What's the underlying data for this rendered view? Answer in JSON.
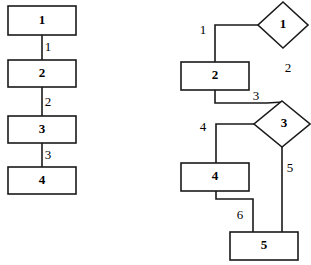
{
  "figure": {
    "type": "diagram",
    "background_color": "#ffffff",
    "line_color": "#1a1a1a"
  },
  "left_diagram": {
    "name": "linear-chain",
    "nodes": [
      {
        "id": "L1",
        "label": "1",
        "shape": "rectangle",
        "x": 8,
        "y": 6,
        "w": 68,
        "h": 29
      },
      {
        "id": "L2",
        "label": "2",
        "shape": "rectangle",
        "x": 8,
        "y": 60,
        "w": 68,
        "h": 27
      },
      {
        "id": "L3",
        "label": "3",
        "shape": "rectangle",
        "x": 8,
        "y": 116,
        "w": 68,
        "h": 27
      },
      {
        "id": "L4",
        "label": "4",
        "shape": "rectangle",
        "x": 8,
        "y": 167,
        "w": 68,
        "h": 27
      }
    ],
    "edges": [
      {
        "from": "L1",
        "to": "L2",
        "label": "1",
        "label_x": 48,
        "label_y": 48
      },
      {
        "from": "L2",
        "to": "L3",
        "label": "2",
        "label_x": 48,
        "label_y": 103
      },
      {
        "from": "L3",
        "to": "L4",
        "label": "3",
        "label_x": 48,
        "label_y": 156
      }
    ]
  },
  "right_diagram": {
    "name": "branching-chain",
    "nodes": [
      {
        "id": "R1",
        "label": "1",
        "shape": "diamond",
        "cx": 283,
        "cy": 25,
        "rx": 25,
        "ry": 23
      },
      {
        "id": "R2",
        "label": "2",
        "shape": "rectangle",
        "x": 181,
        "y": 62,
        "w": 68,
        "h": 28
      },
      {
        "id": "R3",
        "label": "3",
        "shape": "diamond",
        "cx": 282,
        "cy": 124,
        "rx": 28,
        "ry": 23
      },
      {
        "id": "R4",
        "label": "4",
        "shape": "rectangle",
        "x": 181,
        "y": 163,
        "w": 68,
        "h": 28
      },
      {
        "id": "R5",
        "label": "5",
        "shape": "rectangle",
        "x": 230,
        "y": 232,
        "w": 68,
        "h": 28
      }
    ],
    "edges": [
      {
        "from": "R1",
        "to": "R2",
        "label": "1",
        "label_x": 203,
        "label_y": 31
      },
      {
        "from": "R2",
        "to": "R3",
        "label": "3",
        "label_x": 256,
        "label_y": 97
      },
      {
        "from": "R3",
        "to": "R4",
        "label": "4",
        "label_x": 203,
        "label_y": 128
      },
      {
        "from": "R4",
        "to": "R5",
        "label": "6",
        "label_x": 240,
        "label_y": 216
      },
      {
        "from": "R3",
        "to": "R5",
        "label": "5",
        "label_x": 290,
        "label_y": 169
      }
    ],
    "free_labels": [
      {
        "label": "2",
        "x": 288,
        "y": 69
      }
    ]
  }
}
